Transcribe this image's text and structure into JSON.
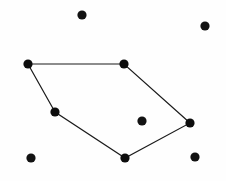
{
  "figure": {
    "width": 226,
    "height": 181,
    "background_color": "#fefefe",
    "point_color": "#121212",
    "edge_color": "#1b1b1b",
    "point_radius": 4.6,
    "edge_width": 1.15
  },
  "chart_data": {
    "type": "scatter",
    "title": "",
    "subtitle": "",
    "xlabel": "",
    "ylabel": "",
    "grid": false,
    "legend": false,
    "axes_visible": false,
    "xlim": [
      0,
      226
    ],
    "ylim": [
      0,
      181
    ],
    "y_axis_direction": "down",
    "series": [
      {
        "name": "hull-vertices",
        "marker": "filled-circle",
        "color": "#0d0d0d",
        "points": [
          {
            "id": "v1",
            "label": "left-upper-vertex",
            "x": 28,
            "y": 64
          },
          {
            "id": "v2",
            "label": "top-right-vertex",
            "x": 124,
            "y": 64
          },
          {
            "id": "v3",
            "label": "right-vertex",
            "x": 190,
            "y": 123
          },
          {
            "id": "v4",
            "label": "bottom-vertex",
            "x": 125,
            "y": 158
          },
          {
            "id": "v5",
            "label": "left-lower-vertex",
            "x": 55,
            "y": 112
          }
        ]
      },
      {
        "name": "interior-points",
        "marker": "filled-circle",
        "color": "#121212",
        "points": [
          {
            "id": "i1",
            "label": "interior-point",
            "x": 142,
            "y": 121
          }
        ]
      },
      {
        "name": "exterior-points",
        "marker": "filled-circle",
        "color": "#121212",
        "points": [
          {
            "id": "e1",
            "label": "top-outer-point",
            "x": 82,
            "y": 15
          },
          {
            "id": "e2",
            "label": "top-right-outer-point",
            "x": 205,
            "y": 26
          },
          {
            "id": "e3",
            "label": "bottom-left-outer-point",
            "x": 31,
            "y": 158
          },
          {
            "id": "e4",
            "label": "bottom-right-outer-point",
            "x": 195,
            "y": 157
          }
        ]
      }
    ],
    "polygon": {
      "name": "convex-hull",
      "closed": true,
      "vertex_ids": [
        "v1",
        "v2",
        "v3",
        "v4",
        "v5"
      ],
      "path": "28,64 124,64 190,123 125,158 55,112"
    },
    "annotations": []
  }
}
